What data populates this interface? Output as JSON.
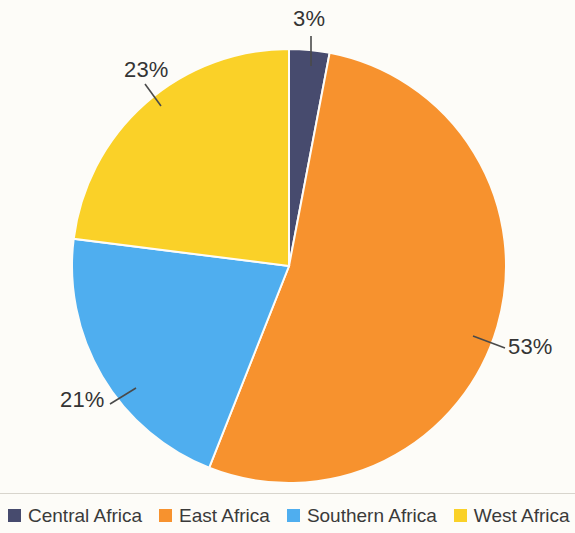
{
  "chart_data": {
    "type": "pie",
    "title": "",
    "subtitle": "",
    "xlabel": "",
    "ylabel": "",
    "grid": false,
    "legend_position": "bottom",
    "start_angle_deg": 0,
    "direction": "clockwise",
    "center": {
      "x": 289,
      "y": 266
    },
    "radius": 217,
    "categories": [
      "Central Africa",
      "East Africa",
      "Southern Africa",
      "West Africa"
    ],
    "values": [
      3,
      53,
      21,
      23
    ],
    "value_unit": "%",
    "data_labels": [
      "3%",
      "53%",
      "21%",
      "23%"
    ],
    "colors": [
      "#474b6e",
      "#f7922e",
      "#4faeef",
      "#fad128"
    ],
    "slices": [
      {
        "name": "Central Africa",
        "value": 3,
        "label": "3%",
        "color": "#474b6e",
        "start_deg": 0,
        "end_deg": 10.8
      },
      {
        "name": "East Africa",
        "value": 53,
        "label": "53%",
        "color": "#f7922e",
        "start_deg": 10.8,
        "end_deg": 201.6
      },
      {
        "name": "Southern Africa",
        "value": 21,
        "label": "21%",
        "color": "#4faeef",
        "start_deg": 201.6,
        "end_deg": 277.2
      },
      {
        "name": "West Africa",
        "value": 23,
        "label": "23%",
        "color": "#fad128",
        "start_deg": 277.2,
        "end_deg": 360
      }
    ]
  },
  "labels": {
    "central": "3%",
    "east": "53%",
    "southern": "21%",
    "west": "23%"
  },
  "legend": {
    "items": [
      {
        "label": "Central Africa",
        "color": "#474b6e"
      },
      {
        "label": "East Africa",
        "color": "#f7922e"
      },
      {
        "label": "Southern Africa",
        "color": "#4faeef"
      },
      {
        "label": "West Africa",
        "color": "#fad128"
      }
    ]
  },
  "style": {
    "background": "#fdfcf8",
    "label_color": "#343434",
    "leader_line_color": "#4a4a4a",
    "divider_color": "#d8d5cd"
  }
}
